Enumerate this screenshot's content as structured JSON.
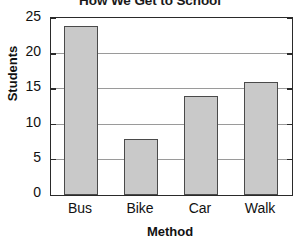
{
  "chart_data": {
    "type": "bar",
    "title": "How We Get to School",
    "xlabel": "Method",
    "ylabel": "Students",
    "categories": [
      "Bus",
      "Bike",
      "Car",
      "Walk"
    ],
    "values": [
      24,
      8,
      14,
      16
    ],
    "ylim": [
      0,
      25
    ],
    "yticks": [
      0,
      5,
      10,
      15,
      20,
      25
    ],
    "ytick_labels": [
      "0",
      "5",
      "10",
      "15",
      "20",
      "25"
    ],
    "grid": true,
    "legend": false,
    "bar_color": "#c9c9c9",
    "bar_border_color": "#4a4a4a",
    "gridline_color": "#9a9a9a",
    "axis_color": "#2a2a2a",
    "text_color": "#111111"
  }
}
